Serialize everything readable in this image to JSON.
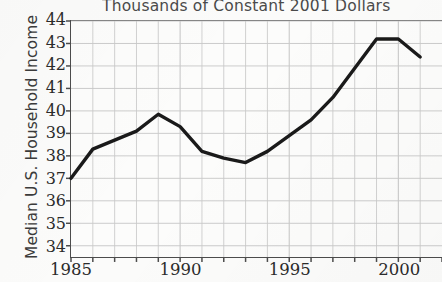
{
  "chart_data": {
    "type": "line",
    "title": "Thousands of Constant 2001 Dollars",
    "xlabel": "",
    "ylabel": "Median U.S. Household Income",
    "xlim": [
      1985,
      2002
    ],
    "ylim": [
      33.5,
      44
    ],
    "grid": true,
    "legend": "none",
    "line_color": "#1a1a1a",
    "grid_color": "#c9c9c9",
    "axis_color": "#4c4c4c",
    "y_ticks": [
      44,
      43,
      42,
      41,
      40,
      39,
      38,
      37,
      36,
      35,
      34
    ],
    "x_ticks": [
      1985,
      1990,
      1995,
      2000
    ],
    "x_tick_labels": [
      "1985",
      "1990",
      "1995",
      "2000"
    ],
    "y_minor_step": 1,
    "x_minor_step": 1,
    "x": [
      1985,
      1986,
      1987,
      1988,
      1989,
      1990,
      1991,
      1992,
      1993,
      1994,
      1995,
      1996,
      1997,
      1998,
      1999,
      2000,
      2001
    ],
    "values": [
      37.0,
      38.3,
      38.7,
      39.1,
      39.85,
      39.3,
      38.2,
      37.9,
      37.7,
      38.2,
      38.9,
      39.6,
      40.6,
      41.9,
      43.2,
      43.2,
      42.4
    ],
    "series": [
      {
        "name": "Median U.S. Household Income",
        "values": [
          37.0,
          38.3,
          38.7,
          39.1,
          39.85,
          39.3,
          38.2,
          37.9,
          37.7,
          38.2,
          38.9,
          39.6,
          40.6,
          41.9,
          43.2,
          43.2,
          42.4
        ]
      }
    ],
    "annotations": {
      "peak_1989": 39.85,
      "trough_1993": 37.7,
      "plateau_1999_2000": 43.2
    }
  }
}
